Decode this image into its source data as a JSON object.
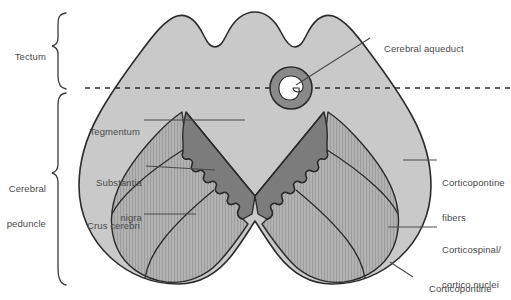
{
  "figure": {
    "type": "anatomical-cross-section"
  },
  "brackets": [
    {
      "id": "tectum",
      "label": "Tectum",
      "label_lines": [
        "Tectum"
      ]
    },
    {
      "id": "cerebral-peduncle",
      "label": "Cerebral peduncle",
      "label_lines": [
        "Cerebral",
        "peduncle"
      ]
    }
  ],
  "labels": {
    "cerebral_aqueduct": {
      "lines": [
        "Cerebral aqueduct"
      ]
    },
    "tegmentum": {
      "lines": [
        "Tegmentum"
      ]
    },
    "substantia_nigra": {
      "lines": [
        "Substantia",
        "nigra"
      ]
    },
    "crus_cerebri": {
      "lines": [
        "Crus cerebri"
      ]
    },
    "corticopontine_fibers": {
      "lines": [
        "Corticopontine",
        "fibers"
      ]
    },
    "corticospinal_cortico_nuclei": {
      "lines": [
        "Corticospinal/",
        "cortico nuclei"
      ]
    },
    "corticopontine": {
      "lines": [
        "Corticopontine"
      ]
    }
  },
  "colors": {
    "background": "#ffffff",
    "outline": "#2b2b2b",
    "tegmentum_fill": "#c9c9c9",
    "substantia_nigra_fill": "#7c7c7c",
    "crus_cerebri_fill": "#b0b0b0",
    "crus_cerebri_stripe": "#9b9b9b",
    "aqueduct_ring": "#8a8a8a",
    "aqueduct_lumen": "#ffffff",
    "leader_line": "#4a4a4a",
    "bracket": "#3a3a3a",
    "dashed_plane": "#2b2b2b",
    "text": "#4a4a4a"
  },
  "plane_line": {
    "style": "dashed",
    "description": "sectional reference plane through cerebral aqueduct"
  }
}
